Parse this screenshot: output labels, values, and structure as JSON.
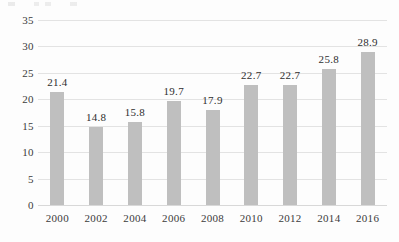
{
  "chart_data": {
    "type": "bar",
    "title": "",
    "subtitle": "",
    "xlabel": "",
    "ylabel": "",
    "categories": [
      "2000",
      "2002",
      "2004",
      "2006",
      "2008",
      "2010",
      "2012",
      "2014",
      "2016"
    ],
    "values": [
      21.4,
      14.8,
      15.8,
      19.7,
      17.9,
      22.7,
      22.7,
      25.8,
      28.9
    ],
    "data_labels": [
      "21.4",
      "14.8",
      "15.8",
      "19.7",
      "17.9",
      "22.7",
      "22.7",
      "25.8",
      "28.9"
    ],
    "ylim": [
      0,
      35
    ],
    "y_ticks": [
      0,
      5,
      10,
      15,
      20,
      25,
      30,
      35
    ],
    "y_tick_labels": [
      "0",
      "5",
      "10",
      "15",
      "20",
      "25",
      "30",
      "35"
    ],
    "grid": true,
    "grid_axis": "y",
    "legend": false,
    "legend_position": "none",
    "bar_color": "#bfbfbf",
    "gridline_color": "#e3e3e3",
    "axis_text_color": "#3b3b3b",
    "data_label_color": "#2e2e2e",
    "background_color": "#fdfdfd"
  }
}
